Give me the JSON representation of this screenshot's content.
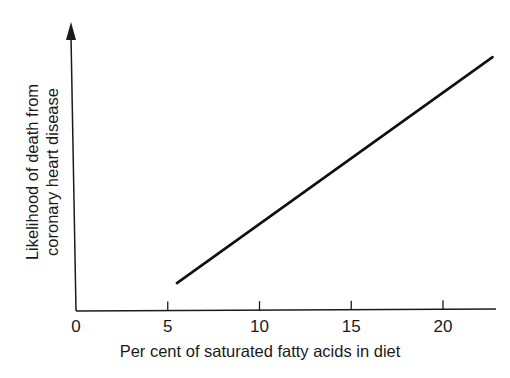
{
  "chart_data": {
    "type": "line",
    "title": "",
    "xlabel": "Per cent of saturated fatty acids in diet",
    "ylabel_lines": [
      "Likelihood of death from",
      "coronary heart disease"
    ],
    "ylabel": "Likelihood of death from coronary heart disease",
    "xlim": [
      0,
      23
    ],
    "ylim": [
      0,
      1
    ],
    "x_ticks": [
      0,
      5,
      10,
      15,
      20
    ],
    "x_tick_labels": [
      "0",
      "5",
      "10",
      "15",
      "20"
    ],
    "y_ticks": [],
    "grid": false,
    "legend": "none",
    "y_axis_arrow": true,
    "series": [
      {
        "name": "Likelihood of death",
        "x": [
          5.5,
          22.7
        ],
        "y": [
          0.1,
          0.91
        ],
        "color": "#111111"
      }
    ]
  }
}
